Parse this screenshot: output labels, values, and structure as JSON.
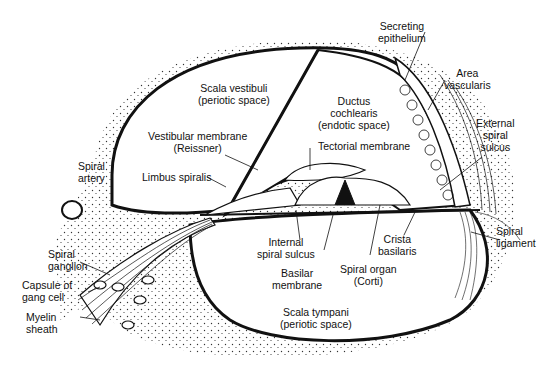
{
  "diagram": {
    "colors": {
      "ink": "#111111",
      "background": "#ffffff",
      "stipple": "#333333"
    },
    "labels": {
      "scala_vestibuli": [
        "Scala vestibuli",
        "(periotic space)"
      ],
      "ductus_cochlearis": [
        "Ductus",
        "cochlearis",
        "(endotic space)"
      ],
      "secreting_epithelium": [
        "Secreting",
        "epithelium"
      ],
      "area_vascularis": [
        "Area",
        "vascularis"
      ],
      "external_spiral_sulcus": [
        "External",
        "spiral",
        "sulcus"
      ],
      "vestibular_membrane": [
        "Vestibular membrane",
        "(Reissner)"
      ],
      "tectorial_membrane": [
        "Tectorial membrane"
      ],
      "spiral_artery": [
        "Spiral",
        "artery"
      ],
      "limbus_spiralis": [
        "Limbus spiralis"
      ],
      "spiral_ligament": [
        "Spiral",
        "ligament"
      ],
      "crista_basilaris": [
        "Crista",
        "basilaris"
      ],
      "internal_spiral_sulcus": [
        "Internal",
        "spiral sulcus"
      ],
      "basilar_membrane": [
        "Basilar",
        "membrane"
      ],
      "spiral_organ": [
        "Spiral organ",
        "(Corti)"
      ],
      "spiral_ganglion": [
        "Spiral",
        "ganglion"
      ],
      "capsule_gang_cell": [
        "Capsule of",
        "gang cell"
      ],
      "myelin_sheath": [
        "Myelin",
        "sheath"
      ],
      "scala_tympani": [
        "Scala tympani",
        "(periotic space)"
      ]
    }
  }
}
